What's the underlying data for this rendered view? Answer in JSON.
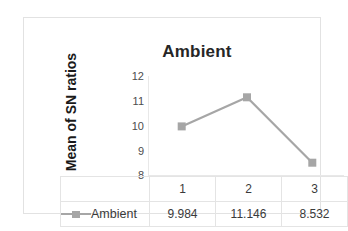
{
  "chart_data": {
    "type": "line",
    "title": "Ambient",
    "xlabel": "",
    "ylabel": "Mean of SN ratios",
    "categories": [
      "1",
      "2",
      "3"
    ],
    "values": [
      9.984,
      11.146,
      8.532
    ],
    "value_labels": [
      "9.984",
      "11.146",
      "8.532"
    ],
    "series": [
      {
        "name": "Ambient",
        "values": [
          9.984,
          11.146,
          8.532
        ]
      }
    ],
    "ylim": [
      8,
      12
    ],
    "yticks": [
      12,
      11,
      10,
      9,
      8
    ],
    "ytick_labels": [
      "12",
      "11",
      "10",
      "9",
      "8"
    ],
    "grid": false,
    "legend_position": "data-table",
    "series_color": "#a6a6a6",
    "marker": "square",
    "data_table": {
      "legend_label": "Ambient",
      "category_row": [
        "1",
        "2",
        "3"
      ],
      "value_row": [
        "9.984",
        "11.146",
        "8.532"
      ]
    }
  },
  "colors": {
    "series": "#a6a6a6",
    "axis": "#e8e8e8",
    "grid_line": "#e4e4e4",
    "frame": "#e2e2e2",
    "title_text": "#262626",
    "tick_text": "#4d4d4d"
  }
}
